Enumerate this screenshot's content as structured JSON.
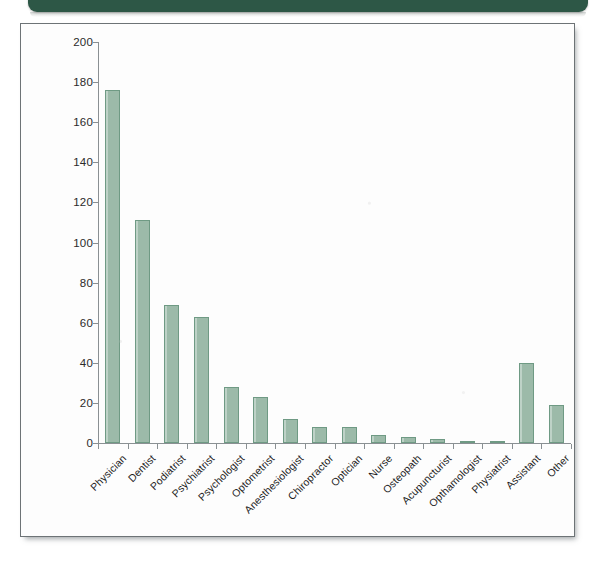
{
  "banner": {
    "color": "#2d5746",
    "label": ""
  },
  "chart_frame": {
    "border_color": "#6d7376",
    "background": "#fdfdfd"
  },
  "chart_data": {
    "type": "bar",
    "title": "",
    "xlabel": "",
    "ylabel": "",
    "ylim": [
      0,
      200
    ],
    "ytick_step": 20,
    "grid": false,
    "legend": "none",
    "bar_fill_color": "#9cbaa9",
    "bar_edge_color": "#6f9a84",
    "ytick_labels": [
      "200",
      "180",
      "160",
      "140",
      "120",
      "100",
      "80",
      "60",
      "40",
      "20",
      "0"
    ],
    "categories": [
      "Physician",
      "Dentist",
      "Podiatrist",
      "Psychiatrist",
      "Psychologist",
      "Optometrist",
      "Anesthesiologist",
      "Chiropractor",
      "Optician",
      "Nurse",
      "Osteopath",
      "Acupuncturist",
      "Opthamologist",
      "Physiatrist",
      "Assistant",
      "Other"
    ],
    "values": [
      176,
      111,
      69,
      63,
      28,
      23,
      12,
      8,
      8,
      4,
      3,
      2,
      1,
      1,
      40,
      19
    ]
  }
}
